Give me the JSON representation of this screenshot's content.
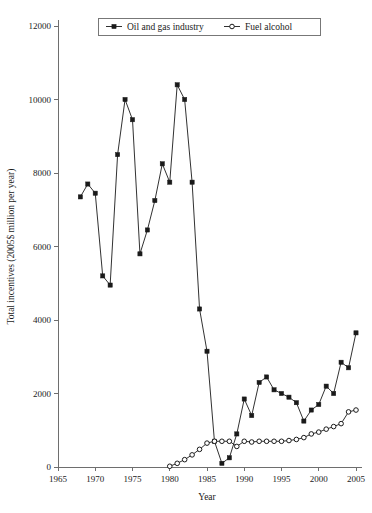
{
  "chart_data": {
    "type": "line",
    "title": "",
    "xlabel": "Year",
    "ylabel": "Total incentives (2005$ million per year)",
    "xlim": [
      1965,
      2005
    ],
    "ylim": [
      0,
      12000
    ],
    "xticks": [
      1965,
      1970,
      1975,
      1980,
      1985,
      1990,
      1995,
      2000,
      2005
    ],
    "yticks": [
      0,
      2000,
      4000,
      6000,
      8000,
      10000,
      12000
    ],
    "grid": false,
    "legend_position": "top-center",
    "series": [
      {
        "name": "Oil and gas industry",
        "marker": "filled-square",
        "color": "#1a1a1a",
        "x": [
          1968,
          1969,
          1970,
          1971,
          1972,
          1973,
          1974,
          1975,
          1976,
          1977,
          1978,
          1979,
          1980,
          1981,
          1982,
          1983,
          1984,
          1985,
          1986,
          1987,
          1988,
          1989,
          1990,
          1991,
          1992,
          1993,
          1994,
          1995,
          1996,
          1997,
          1998,
          1999,
          2000,
          2001,
          2002,
          2003,
          2004,
          2005
        ],
        "values": [
          7350,
          7700,
          7450,
          5200,
          4950,
          8500,
          10000,
          9450,
          5800,
          6450,
          7250,
          8250,
          7750,
          10400,
          10000,
          7750,
          4300,
          3150,
          700,
          100,
          250,
          900,
          1850,
          1400,
          2300,
          2450,
          2100,
          2000,
          1900,
          1750,
          1250,
          1550,
          1700,
          2200,
          2000,
          2850,
          2700,
          3650
        ]
      },
      {
        "name": "Fuel alcohol",
        "marker": "open-circle",
        "color": "#1a1a1a",
        "x": [
          1980,
          1981,
          1982,
          1983,
          1984,
          1985,
          1986,
          1987,
          1988,
          1989,
          1990,
          1991,
          1992,
          1993,
          1994,
          1995,
          1996,
          1997,
          1998,
          1999,
          2000,
          2001,
          2002,
          2003,
          2004,
          2005
        ],
        "values": [
          20,
          100,
          200,
          330,
          480,
          650,
          700,
          700,
          700,
          560,
          700,
          680,
          700,
          700,
          700,
          700,
          720,
          750,
          800,
          900,
          950,
          1030,
          1100,
          1180,
          1500,
          1550
        ]
      }
    ]
  },
  "legend": {
    "items": [
      {
        "label": "Oil and gas industry",
        "marker": "filled-square"
      },
      {
        "label": "Fuel alcohol",
        "marker": "open-circle"
      }
    ]
  },
  "axes": {
    "x_title": "Year",
    "y_title": "Total incentives (2005$ million per year)"
  }
}
